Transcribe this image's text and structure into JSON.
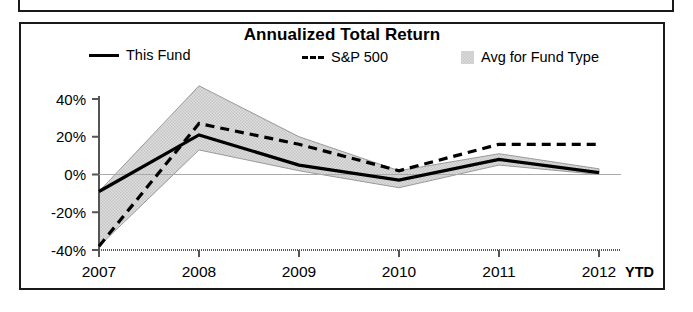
{
  "chart_title": "Annualized Total Return",
  "legend": {
    "fund": {
      "label": "This Fund",
      "marker": "solid-line-key-icon"
    },
    "sp500": {
      "label": "S&P 500",
      "marker": "dashed-line-key-icon"
    },
    "avg": {
      "label": "Avg for Fund Type",
      "marker": "shaded-band-swatch-icon"
    }
  },
  "axis": {
    "ytick_labels": [
      "40%",
      "20%",
      "0%",
      "-20%",
      "-40%"
    ],
    "xtick_labels": [
      "2007",
      "2008",
      "2009",
      "2010",
      "2011",
      "2012"
    ],
    "ytd_label": "YTD"
  },
  "colors": {
    "line": "#000000",
    "band_fill": "#d9d9d9",
    "band_edge": "#9a9a9a",
    "frame": "#1a1a1a",
    "axis": "#555555"
  },
  "chart_data": {
    "type": "line",
    "title": "Annualized Total Return",
    "xlabel": "",
    "ylabel": "",
    "x": [
      "2007",
      "2008",
      "2009",
      "2010",
      "2011",
      "2012"
    ],
    "categories": [
      "2007",
      "2008",
      "2009",
      "2010",
      "2011",
      "2012"
    ],
    "ylim": [
      -40,
      40
    ],
    "yticks": [
      40,
      20,
      0,
      -20,
      -40
    ],
    "grid": false,
    "legend_position": "top",
    "note": "Last x category 2012 is year-to-date (YTD)",
    "series": [
      {
        "name": "This Fund",
        "style": "solid",
        "values": [
          -9,
          21,
          5,
          -3,
          8,
          1
        ]
      },
      {
        "name": "S&P 500",
        "style": "dashed",
        "values": [
          -38,
          27,
          16,
          2,
          16,
          16
        ]
      },
      {
        "name": "Avg for Fund Type",
        "style": "band",
        "band_lower": [
          -38,
          13,
          2,
          -7,
          5,
          0
        ],
        "band_upper": [
          -9,
          47,
          20,
          2,
          11,
          3
        ]
      }
    ]
  }
}
